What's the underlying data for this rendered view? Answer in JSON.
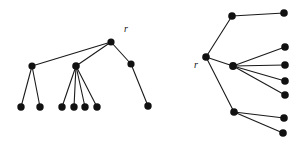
{
  "figure": {
    "name": "two-rooted-trees-diagram",
    "width": 303,
    "height": 151,
    "background_color": "#ffffff",
    "node_color": "#111111",
    "edge_color": "#1a1a1a",
    "node_radius": 3.4,
    "leaf_radius": 3.6,
    "labels": [
      {
        "id": "label-left-root",
        "text": "r",
        "x": 124,
        "y": 32
      },
      {
        "id": "label-right-root",
        "text": "r",
        "x": 194,
        "y": 68
      }
    ],
    "trees": [
      {
        "id": "left-tree",
        "name": "left-tree",
        "root": "L-root",
        "nodes": [
          {
            "id": "L-root",
            "name": "left-tree-root-node",
            "x": 111,
            "y": 42,
            "r": 3.6,
            "kind": "root"
          },
          {
            "id": "L-a",
            "name": "left-tree-internal-node-a",
            "x": 32,
            "y": 66,
            "r": 3.6,
            "kind": "internal"
          },
          {
            "id": "L-b",
            "name": "left-tree-internal-node-b",
            "x": 76,
            "y": 66,
            "r": 3.8,
            "kind": "internal"
          },
          {
            "id": "L-c",
            "name": "left-tree-internal-node-c",
            "x": 131,
            "y": 64,
            "r": 3.6,
            "kind": "internal"
          },
          {
            "id": "L-a1",
            "name": "left-tree-leaf-node",
            "x": 21,
            "y": 107,
            "r": 3.7,
            "kind": "leaf"
          },
          {
            "id": "L-a2",
            "name": "left-tree-leaf-node",
            "x": 40,
            "y": 107,
            "r": 3.7,
            "kind": "leaf"
          },
          {
            "id": "L-b1",
            "name": "left-tree-leaf-node",
            "x": 62,
            "y": 107,
            "r": 3.7,
            "kind": "leaf"
          },
          {
            "id": "L-b2",
            "name": "left-tree-leaf-node",
            "x": 74,
            "y": 107,
            "r": 3.7,
            "kind": "leaf"
          },
          {
            "id": "L-b3",
            "name": "left-tree-leaf-node",
            "x": 85,
            "y": 107,
            "r": 3.7,
            "kind": "leaf"
          },
          {
            "id": "L-b4",
            "name": "left-tree-leaf-node",
            "x": 97,
            "y": 107,
            "r": 3.7,
            "kind": "leaf"
          },
          {
            "id": "L-c1",
            "name": "left-tree-leaf-node",
            "x": 148,
            "y": 106,
            "r": 3.7,
            "kind": "leaf"
          }
        ],
        "edges": [
          [
            "L-root",
            "L-a"
          ],
          [
            "L-root",
            "L-b"
          ],
          [
            "L-root",
            "L-c"
          ],
          [
            "L-a",
            "L-a1"
          ],
          [
            "L-a",
            "L-a2"
          ],
          [
            "L-b",
            "L-b1"
          ],
          [
            "L-b",
            "L-b2"
          ],
          [
            "L-b",
            "L-b3"
          ],
          [
            "L-b",
            "L-b4"
          ],
          [
            "L-c",
            "L-c1"
          ]
        ]
      },
      {
        "id": "right-tree",
        "name": "right-tree",
        "root": "R-root",
        "nodes": [
          {
            "id": "R-root",
            "name": "right-tree-root-node",
            "x": 206,
            "y": 57,
            "r": 3.8,
            "kind": "root"
          },
          {
            "id": "R-a",
            "name": "right-tree-internal-node-a",
            "x": 232,
            "y": 16,
            "r": 3.8,
            "kind": "internal"
          },
          {
            "id": "R-b",
            "name": "right-tree-internal-node-b",
            "x": 233,
            "y": 66,
            "r": 3.9,
            "kind": "internal"
          },
          {
            "id": "R-c",
            "name": "right-tree-internal-node-c",
            "x": 234,
            "y": 112,
            "r": 3.8,
            "kind": "internal"
          },
          {
            "id": "R-a1",
            "name": "right-tree-leaf-node",
            "x": 284,
            "y": 13,
            "r": 3.8,
            "kind": "leaf"
          },
          {
            "id": "R-b1",
            "name": "right-tree-leaf-node",
            "x": 285,
            "y": 47,
            "r": 3.8,
            "kind": "leaf"
          },
          {
            "id": "R-b2",
            "name": "right-tree-leaf-node",
            "x": 285,
            "y": 65,
            "r": 3.8,
            "kind": "leaf"
          },
          {
            "id": "R-b3",
            "name": "right-tree-leaf-node",
            "x": 285,
            "y": 81,
            "r": 3.8,
            "kind": "leaf"
          },
          {
            "id": "R-b4",
            "name": "right-tree-leaf-node",
            "x": 285,
            "y": 95,
            "r": 3.8,
            "kind": "leaf"
          },
          {
            "id": "R-c1",
            "name": "right-tree-leaf-node",
            "x": 284,
            "y": 118,
            "r": 3.8,
            "kind": "leaf"
          },
          {
            "id": "R-c2",
            "name": "right-tree-leaf-node",
            "x": 283,
            "y": 133,
            "r": 3.8,
            "kind": "leaf"
          }
        ],
        "edges": [
          [
            "R-root",
            "R-a"
          ],
          [
            "R-root",
            "R-b"
          ],
          [
            "R-root",
            "R-c"
          ],
          [
            "R-a",
            "R-a1"
          ],
          [
            "R-b",
            "R-b1"
          ],
          [
            "R-b",
            "R-b2"
          ],
          [
            "R-b",
            "R-b3"
          ],
          [
            "R-b",
            "R-b4"
          ],
          [
            "R-c",
            "R-c1"
          ],
          [
            "R-c",
            "R-c2"
          ]
        ]
      }
    ]
  }
}
